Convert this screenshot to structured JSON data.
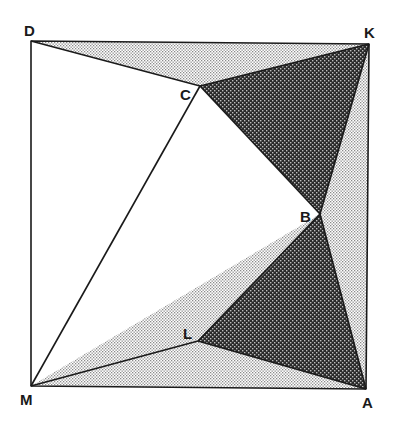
{
  "diagram": {
    "type": "geometry-figure",
    "points": {
      "D": {
        "label": "D",
        "x": 31,
        "y": 41
      },
      "K": {
        "label": "K",
        "x": 369,
        "y": 44
      },
      "A": {
        "label": "A",
        "x": 366,
        "y": 389
      },
      "M": {
        "label": "M",
        "x": 31,
        "y": 386
      },
      "C": {
        "label": "C",
        "x": 200,
        "y": 86
      },
      "B": {
        "label": "B",
        "x": 320,
        "y": 214
      },
      "L": {
        "label": "L",
        "x": 198,
        "y": 341
      }
    },
    "labels": {
      "D": "D",
      "K": "K",
      "A": "A",
      "M": "M",
      "C": "C",
      "B": "B",
      "L": "L"
    },
    "regions": {
      "dark": [
        "KCB",
        "BLA"
      ],
      "light": [
        "DKC",
        "KBA",
        "MBA-minus-BLA"
      ]
    },
    "colors": {
      "stroke": "#1a1a1a",
      "dark_fill": "#3a3a3a",
      "light_fill": "#d9d9d9",
      "background": "#ffffff"
    }
  }
}
